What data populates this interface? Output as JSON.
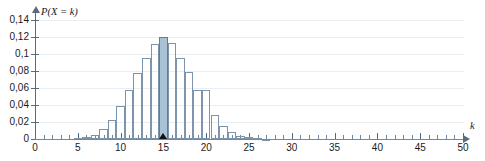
{
  "chart_data": {
    "type": "bar",
    "title": "",
    "xlabel": "k",
    "ylabel": "P(X = k)",
    "xlim": [
      0,
      50
    ],
    "ylim": [
      0,
      0.145
    ],
    "grid": true,
    "legend": "none",
    "decimal_separator": ",",
    "x_tick_labels": [
      "0",
      "5",
      "10",
      "15",
      "20",
      "25",
      "30",
      "35",
      "40",
      "45",
      "50"
    ],
    "x_tick_values": [
      0,
      5,
      10,
      15,
      20,
      25,
      30,
      35,
      40,
      45,
      50
    ],
    "x_minor_tick_step": 1,
    "y_tick_labels": [
      "0",
      "0,02",
      "0,04",
      "0,06",
      "0,08",
      "0,1",
      "0,12",
      "0,14"
    ],
    "y_tick_values": [
      0,
      0.02,
      0.04,
      0.06,
      0.08,
      0.1,
      0.12,
      0.14
    ],
    "highlight_k": 15,
    "marker_k": 15,
    "colors": {
      "bar_outline": "#7d94ab",
      "bar_highlight_fill": "#a9c2d6",
      "axis": "#5b6b7c",
      "xaxis": "#6b89a8",
      "grid": "#e8eef3",
      "marker": "#111111"
    },
    "categories": [
      0,
      1,
      2,
      3,
      4,
      5,
      6,
      7,
      8,
      9,
      10,
      11,
      12,
      13,
      14,
      15,
      16,
      17,
      18,
      19,
      20,
      21,
      22,
      23,
      24,
      25,
      26,
      27,
      28,
      29,
      30,
      31,
      32,
      33,
      34,
      35,
      36,
      37,
      38,
      39,
      40,
      41,
      42,
      43,
      44,
      45,
      46,
      47,
      48,
      49,
      50
    ],
    "values": [
      0,
      0,
      0,
      0,
      0,
      0.001,
      0.002,
      0.005,
      0.012,
      0.023,
      0.039,
      0.058,
      0.078,
      0.095,
      0.112,
      0.12,
      0.113,
      0.095,
      0.079,
      0.058,
      0.058,
      0.028,
      0.015,
      0.008,
      0.004,
      0.002,
      0.001,
      0.0005,
      0.0002,
      0.0001,
      0,
      0,
      0,
      0,
      0,
      0,
      0,
      0,
      0,
      0,
      0,
      0,
      0,
      0,
      0,
      0,
      0,
      0,
      0,
      0,
      0
    ]
  },
  "clipped_top_text": ""
}
